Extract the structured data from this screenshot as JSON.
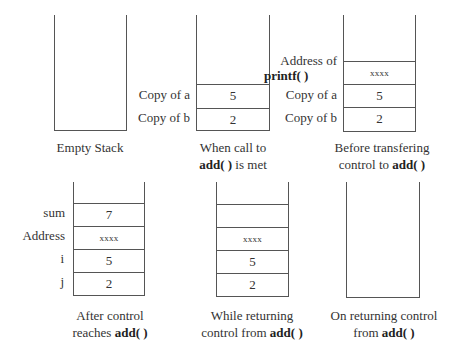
{
  "diagrams": [
    {
      "caption_lines": [
        "Empty Stack"
      ],
      "caption_bold": [],
      "cells": []
    },
    {
      "caption_line1": "When call to",
      "caption_line2_bold": "add( )",
      "caption_line2_rest": " is met",
      "cells": [
        {
          "label": "Copy of a",
          "value": "5"
        },
        {
          "label": "Copy of b",
          "value": "2"
        }
      ]
    },
    {
      "caption_line1": "Before transfering",
      "caption_line2_pre": "control to ",
      "caption_line2_bold": "add( )",
      "label_addr_line1": "Address of",
      "label_addr_line2_bold": "printf( )",
      "cells": [
        {
          "label": "Address of printf( )",
          "value": "xxxx"
        },
        {
          "label": "Copy of a",
          "value": "5"
        },
        {
          "label": "Copy of b",
          "value": "2"
        }
      ]
    },
    {
      "caption_line1": "After control",
      "caption_line2_pre": "reaches ",
      "caption_line2_bold": "add( )",
      "cells": [
        {
          "label": "sum",
          "value": "7"
        },
        {
          "label": "Address",
          "value": "xxxx"
        },
        {
          "label": "i",
          "value": "5"
        },
        {
          "label": "j",
          "value": "2"
        }
      ]
    },
    {
      "caption_line1": "While returning",
      "caption_line2_pre": "control from ",
      "caption_line2_bold": "add( )",
      "cells": [
        {
          "label": "",
          "value": ""
        },
        {
          "label": "",
          "value": "xxxx"
        },
        {
          "label": "",
          "value": "5"
        },
        {
          "label": "",
          "value": "2"
        }
      ]
    },
    {
      "caption_line1": "On returning control",
      "caption_line2_pre": "from ",
      "caption_line2_bold": "add( )",
      "cells": []
    }
  ],
  "empty_caption": "Empty Stack"
}
